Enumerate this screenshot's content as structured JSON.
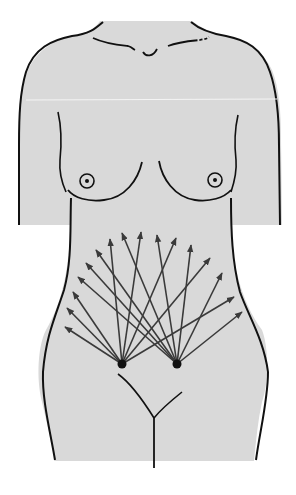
{
  "figure": {
    "title": "Abdominal incision / tension lines diagram on female torso",
    "colors": {
      "background": "#ffffff",
      "body_fill": "#d9d9d9",
      "outline": "#111111",
      "arrow": "#3a3a3a",
      "seam_line": "#f4f4f4"
    },
    "origins": [
      {
        "name": "left-origin-point",
        "x": 122,
        "y": 364
      },
      {
        "name": "right-origin-point",
        "x": 177,
        "y": 364
      }
    ],
    "arrows_left_origin": [
      {
        "x": 65,
        "y": 327
      },
      {
        "x": 67,
        "y": 308
      },
      {
        "x": 73,
        "y": 292
      },
      {
        "x": 110,
        "y": 239
      },
      {
        "x": 141,
        "y": 232
      },
      {
        "x": 176,
        "y": 238
      },
      {
        "x": 210,
        "y": 258
      },
      {
        "x": 234,
        "y": 297
      }
    ],
    "arrows_right_origin": [
      {
        "x": 78,
        "y": 277
      },
      {
        "x": 86,
        "y": 263
      },
      {
        "x": 96,
        "y": 250
      },
      {
        "x": 122,
        "y": 233
      },
      {
        "x": 157,
        "y": 235
      },
      {
        "x": 191,
        "y": 245
      },
      {
        "x": 222,
        "y": 273
      },
      {
        "x": 242,
        "y": 312
      }
    ]
  }
}
